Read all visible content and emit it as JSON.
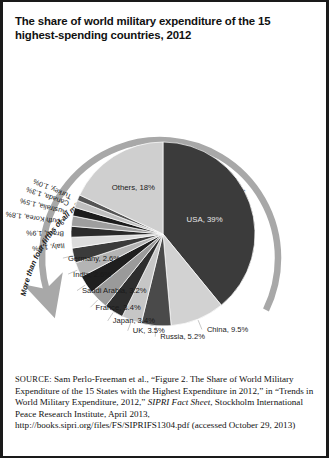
{
  "figure": {
    "title": "The share of world military expenditure of the 15 highest-spending countries, 2012",
    "annotation": "More than four-fifths of all military expenditure in 2012 was made by 15 states",
    "arrow_color": "#a8a8a8",
    "border_color": "#1a1a1a"
  },
  "source": {
    "label": "SOURCE:",
    "text_1": " Sam Perlo-Freeman et al., “Figure 2. The Share of World Military Expenditure of the 15 States with the Highest Expenditure in 2012,” in “Trends in World Military Expenditure, 2012,” ",
    "italic_1": "SIPRI Fact Sheet",
    "text_2": ", Stockholm International Peace Research Institute, April 2013, http://books.sipri.org/files/FS/SIPRIFS1304.pdf (accessed October 29, 2013)"
  },
  "chart_data": {
    "type": "pie",
    "title": "The share of world military expenditure of the 15 highest-spending countries, 2012",
    "xlabel": "",
    "ylabel": "",
    "unit": "percent of world military expenditure",
    "legend_position": "none",
    "grid": false,
    "start_angle_deg": -90,
    "direction": "clockwise",
    "categories": [
      "USA",
      "China",
      "Russia",
      "UK",
      "Japan",
      "France",
      "Saudi Arabia",
      "India",
      "Germany",
      "Italy",
      "Brazil",
      "South Korea",
      "Australia",
      "Canada",
      "Turkey",
      "Others"
    ],
    "values": [
      39,
      9.5,
      5.2,
      3.5,
      3.4,
      3.4,
      3.2,
      2.6,
      2.6,
      1.9,
      1.9,
      1.8,
      1.5,
      1.3,
      1.0,
      18
    ],
    "slices": [
      {
        "name": "USA",
        "value": 39,
        "label": "USA, 39%",
        "color": "#3b3b3b",
        "label_placement": "inside"
      },
      {
        "name": "China",
        "value": 9.5,
        "label": "China, 9.5%",
        "color": "#d2d2d2",
        "label_placement": "outside"
      },
      {
        "name": "Russia",
        "value": 5.2,
        "label": "Russia, 5.2%",
        "color": "#4a4a4a",
        "label_placement": "outside"
      },
      {
        "name": "UK",
        "value": 3.5,
        "label": "UK, 3.5%",
        "color": "#c6c6c6",
        "label_placement": "outside"
      },
      {
        "name": "Japan",
        "value": 3.4,
        "label": "Japan, 3.4%",
        "color": "#2e2e2e",
        "label_placement": "outside"
      },
      {
        "name": "France",
        "value": 3.4,
        "label": "France, 3.4%",
        "color": "#9a9a9a",
        "label_placement": "outside"
      },
      {
        "name": "Saudi Arabia",
        "value": 3.2,
        "label": "Saudi Arabia, 3.2%",
        "color": "#1f1f1f",
        "label_placement": "outside"
      },
      {
        "name": "India",
        "value": 2.6,
        "label": "India, 2.6%",
        "color": "#b4b4b4",
        "label_placement": "outside"
      },
      {
        "name": "Germany",
        "value": 2.6,
        "label": "Germany, 2.6%",
        "color": "#3b3b3b",
        "label_placement": "outside"
      },
      {
        "name": "Italy",
        "value": 1.9,
        "label": "Italy, 1.9%",
        "color": "#dcdcdc",
        "label_placement": "radial"
      },
      {
        "name": "Brazil",
        "value": 1.9,
        "label": "Brazil, 1.9%",
        "color": "#2a2a2a",
        "label_placement": "radial"
      },
      {
        "name": "South Korea",
        "value": 1.8,
        "label": "South Korea, 1.8%",
        "color": "#9e9e9e",
        "label_placement": "radial"
      },
      {
        "name": "Australia",
        "value": 1.5,
        "label": "Australia, 1.5%",
        "color": "#1c1c1c",
        "label_placement": "radial"
      },
      {
        "name": "Canada",
        "value": 1.3,
        "label": "Canada, 1.3%",
        "color": "#c0c0c0",
        "label_placement": "radial"
      },
      {
        "name": "Turkey",
        "value": 1.0,
        "label": "Turkey, 1.0%",
        "color": "#555555",
        "label_placement": "radial"
      },
      {
        "name": "Others",
        "value": 18,
        "label": "Others, 18%",
        "color": "#cfcfcf",
        "label_placement": "inside"
      }
    ]
  }
}
